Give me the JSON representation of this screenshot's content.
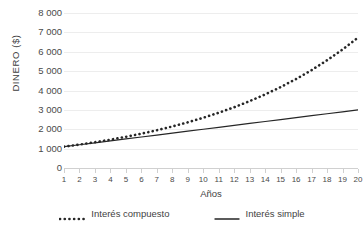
{
  "chart_data": {
    "type": "line",
    "title": "",
    "subtitle": "",
    "xlabel": "Años",
    "ylabel": "DINERO ($)",
    "xlim": [
      1,
      20
    ],
    "ylim": [
      0,
      8000
    ],
    "grid": true,
    "legend_position": "bottom",
    "x": [
      1,
      2,
      3,
      4,
      5,
      6,
      7,
      8,
      9,
      10,
      11,
      12,
      13,
      14,
      15,
      16,
      17,
      18,
      19,
      20
    ],
    "x_tick_labels": [
      "1",
      "2",
      "3",
      "4",
      "5",
      "6",
      "7",
      "8",
      "9",
      "10",
      "11",
      "12",
      "13",
      "14",
      "15",
      "16",
      "17",
      "18",
      "19",
      "20"
    ],
    "y_ticks": [
      0,
      1000,
      2000,
      3000,
      4000,
      5000,
      6000,
      7000,
      8000
    ],
    "y_tick_labels": [
      "0",
      "1 000",
      "2 000",
      "3 000",
      "4 000",
      "5 000",
      "6 000",
      "7 000",
      "8 000"
    ],
    "series": [
      {
        "name": "Interés compuesto",
        "style": "dotted",
        "color": "#262626",
        "values": [
          1100,
          1210,
          1331,
          1464,
          1611,
          1772,
          1949,
          2144,
          2358,
          2594,
          2853,
          3138,
          3452,
          3797,
          4177,
          4595,
          5054,
          5560,
          6116,
          6727
        ]
      },
      {
        "name": "Interés simple",
        "style": "solid",
        "color": "#262626",
        "values": [
          1100,
          1200,
          1300,
          1400,
          1500,
          1600,
          1700,
          1800,
          1900,
          2000,
          2100,
          2200,
          2300,
          2400,
          2500,
          2600,
          2700,
          2800,
          2900,
          3000
        ]
      }
    ],
    "colors": {
      "gridline": "#ededed",
      "axis": "#d0d0d0",
      "text": "#3f3f3f",
      "series": "#262626"
    }
  },
  "legend": {
    "items": [
      {
        "label": "Interés compuesto",
        "swatch": "dotted-line-swatch"
      },
      {
        "label": "Interés simple",
        "swatch": "solid-line-swatch"
      }
    ]
  }
}
